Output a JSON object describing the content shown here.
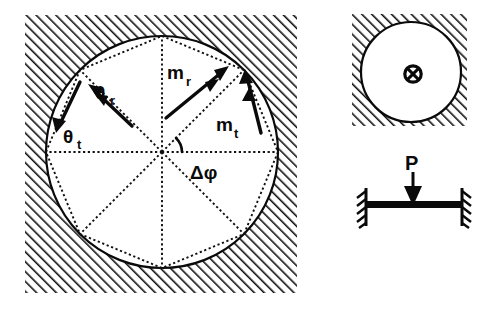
{
  "figure": {
    "background_color": "#ffffff",
    "ink_color": "#0a0a0a"
  },
  "panels": {
    "left": {
      "name": "discretized-ring-panel",
      "frame": {
        "x": 25,
        "y": 15,
        "width": 272,
        "height": 278
      },
      "hatch": {
        "pattern": "diagonal-lines",
        "angle_deg": 45,
        "spacing": 5,
        "color": "#111111"
      },
      "circle": {
        "cx": 162,
        "cy": 152,
        "r": 116,
        "stroke_color": "#0a0a0a"
      },
      "polygon": {
        "sides": 8,
        "inscribed": true,
        "r": 116,
        "stroke_style": "dotted"
      },
      "spokes": {
        "count": 8,
        "stroke_style": "dotted",
        "origin": [
          162,
          152
        ]
      },
      "labels": [
        {
          "name": "theta-r-label",
          "base": "θ",
          "sub": "r",
          "x": 103,
          "y": 92
        },
        {
          "name": "theta-t-label",
          "base": "θ",
          "sub": "t",
          "x": 66,
          "y": 137
        },
        {
          "name": "m-r-label",
          "base": "m",
          "sub": "r",
          "x": 176,
          "y": 72
        },
        {
          "name": "m-t-label",
          "base": "m",
          "sub": "t",
          "x": 221,
          "y": 124
        },
        {
          "name": "delta-phi-label",
          "text": "Δφ",
          "x": 196,
          "y": 172
        }
      ],
      "arrows": [
        {
          "name": "theta-r-arrow",
          "type": "double-head",
          "x1": 130,
          "y1": 124,
          "x2": 90,
          "y2": 86
        },
        {
          "name": "theta-t-arrow",
          "type": "single-head",
          "x1": 78,
          "y1": 79,
          "x2": 57,
          "y2": 128
        },
        {
          "name": "m-r-arrow",
          "type": "double-head",
          "x1": 168,
          "y1": 116,
          "x2": 224,
          "y2": 70
        },
        {
          "name": "m-t-arrow",
          "type": "double-head",
          "x1": 262,
          "y1": 131,
          "x2": 246,
          "y2": 74
        }
      ],
      "angle_arc": {
        "name": "delta-phi-arc",
        "cx": 162,
        "cy": 152,
        "r": 20,
        "start_deg": 0,
        "end_deg": 45
      }
    },
    "right_top": {
      "name": "cross-section-panel",
      "frame": {
        "x": 352,
        "y": 14,
        "width": 115,
        "height": 112
      },
      "hatch": {
        "pattern": "diagonal-lines",
        "angle_deg": 45,
        "spacing": 5,
        "color": "#111111"
      },
      "circle": {
        "cx": 411,
        "cy": 72,
        "r": 50,
        "stroke_color": "#0a0a0a"
      },
      "symbol": {
        "name": "cross-in-circle-icon",
        "glyph": "⊗",
        "cx": 413,
        "cy": 74,
        "r": 8
      }
    },
    "right_bottom": {
      "name": "beam-panel",
      "load_label": "P",
      "load_label_pos": {
        "x": 412,
        "y": 163
      },
      "load_arrow": {
        "name": "point-load-arrow",
        "x": 413,
        "y_start": 166,
        "y_end": 205,
        "head_width": 18,
        "head_height": 19
      },
      "beam": {
        "name": "beam-member",
        "x1": 366,
        "y1": 205,
        "x2": 462,
        "y2": 205,
        "thickness": 7
      },
      "supports": [
        {
          "name": "left-fixed-support",
          "x": 366,
          "y_top": 188,
          "y_bottom": 224,
          "hatch_side": "left"
        },
        {
          "name": "right-fixed-support",
          "x": 462,
          "y_top": 188,
          "y_bottom": 224,
          "hatch_side": "right"
        }
      ]
    }
  }
}
